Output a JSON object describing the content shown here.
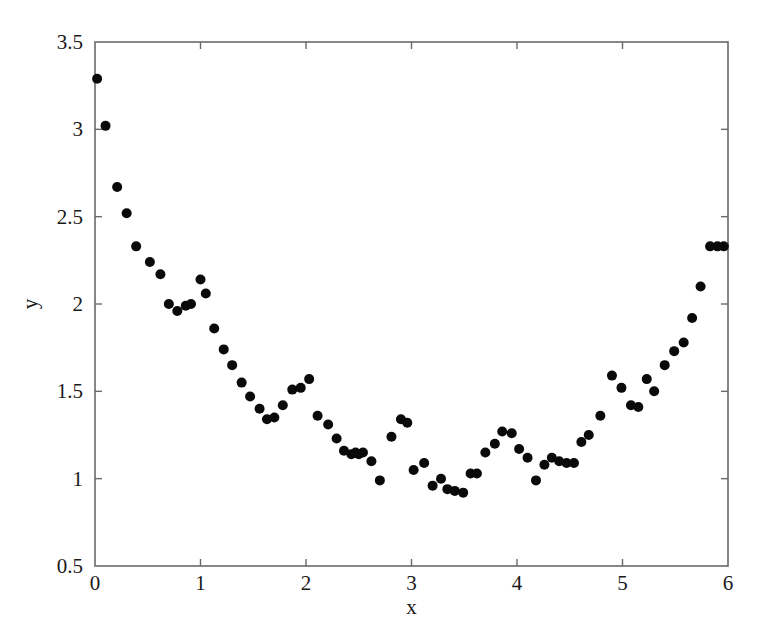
{
  "chart_data": {
    "type": "scatter",
    "title": "",
    "subtitle": "",
    "xlabel": "x",
    "ylabel": "y",
    "xlim": [
      0,
      6
    ],
    "ylim": [
      0.5,
      3.5
    ],
    "xticks": [
      0,
      1,
      2,
      3,
      4,
      5,
      6
    ],
    "xtick_labels": [
      "0",
      "1",
      "2",
      "3",
      "4",
      "5",
      "6"
    ],
    "yticks": [
      0.5,
      1,
      1.5,
      2,
      2.5,
      3,
      3.5
    ],
    "ytick_labels": [
      "0.5",
      "1",
      "1.5",
      "2",
      "2.5",
      "3",
      "3.5"
    ],
    "grid": false,
    "legend": null,
    "legend_position": "none",
    "frame": "box",
    "tick_direction": "in",
    "marker": "filled-circle",
    "marker_color": "#0a0a0a",
    "marker_size_px": 5.0,
    "background_color": "#ffffff",
    "axis_color": "#6a6a6a",
    "n_points": 76,
    "series": [
      {
        "name": "data",
        "x": [
          0.02,
          0.1,
          0.21,
          0.3,
          0.39,
          0.52,
          0.62,
          0.7,
          0.78,
          0.86,
          0.91,
          1.0,
          1.05,
          1.13,
          1.22,
          1.3,
          1.39,
          1.47,
          1.56,
          1.63,
          1.7,
          1.78,
          1.87,
          1.95,
          2.03,
          2.11,
          2.21,
          2.29,
          2.36,
          2.43,
          2.47,
          2.5,
          2.54,
          2.62,
          2.7,
          2.81,
          2.9,
          2.96,
          3.02,
          3.12,
          3.2,
          3.28,
          3.34,
          3.41,
          3.49,
          3.56,
          3.62,
          3.7,
          3.79,
          3.86,
          3.95,
          4.02,
          4.1,
          4.18,
          4.26,
          4.33,
          4.4,
          4.47,
          4.54,
          4.61,
          4.68,
          4.79,
          4.9,
          4.99,
          5.08,
          5.15,
          5.23,
          5.3,
          5.4,
          5.49,
          5.58,
          5.66,
          5.74,
          5.83,
          5.9,
          5.96
        ],
        "y": [
          3.29,
          3.02,
          2.67,
          2.52,
          2.33,
          2.24,
          2.17,
          2.0,
          1.96,
          1.99,
          2.0,
          2.14,
          2.06,
          1.86,
          1.74,
          1.65,
          1.55,
          1.47,
          1.4,
          1.34,
          1.35,
          1.42,
          1.51,
          1.52,
          1.57,
          1.36,
          1.31,
          1.23,
          1.16,
          1.14,
          1.15,
          1.14,
          1.15,
          1.1,
          0.99,
          1.24,
          1.34,
          1.32,
          1.05,
          1.09,
          0.96,
          1.0,
          0.94,
          0.93,
          0.92,
          1.03,
          1.03,
          1.15,
          1.2,
          1.27,
          1.26,
          1.17,
          1.12,
          0.99,
          1.08,
          1.12,
          1.1,
          1.09,
          1.09,
          1.21,
          1.25,
          1.36,
          1.59,
          1.52,
          1.42,
          1.41,
          1.57,
          1.5,
          1.65,
          1.73,
          1.78,
          1.92,
          2.1,
          2.33,
          2.33,
          2.33
        ]
      }
    ]
  },
  "figure": {
    "plot_area": {
      "left_px": 95,
      "top_px": 42,
      "right_px": 728,
      "bottom_px": 566
    }
  }
}
